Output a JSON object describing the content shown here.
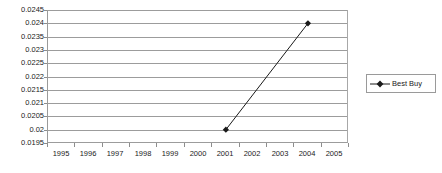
{
  "chart_data": {
    "type": "line",
    "title": "",
    "xlabel": "",
    "ylabel": "",
    "x_categories": [
      "1995",
      "1996",
      "1997",
      "1998",
      "1999",
      "2000",
      "2001",
      "2002",
      "2003",
      "2004",
      "2005"
    ],
    "y_ticks": [
      "0.0195",
      "0.02",
      "0.0205",
      "0.021",
      "0.0215",
      "0.022",
      "0.0225",
      "0.023",
      "0.0235",
      "0.024",
      "0.0245"
    ],
    "ylim": [
      0.0195,
      0.0245
    ],
    "y_step": 0.0005,
    "grid": true,
    "legend_position": "right",
    "series": [
      {
        "name": "Best Buy",
        "marker": "diamond",
        "color": "#1a1a1a",
        "points": [
          {
            "x": "2001",
            "y": 0.02
          },
          {
            "x": "2004",
            "y": 0.024
          }
        ]
      }
    ]
  },
  "legend": {
    "entries": [
      {
        "label": "Best Buy"
      }
    ]
  },
  "colors": {
    "gridline": "#9c9c9c",
    "axis": "#9a9a9a",
    "series": "#1a1a1a",
    "text": "#1a1a1a",
    "background": "#ffffff"
  }
}
